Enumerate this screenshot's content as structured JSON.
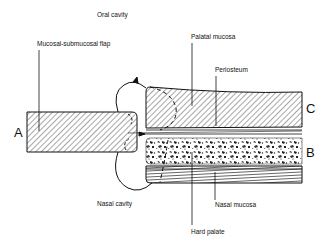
{
  "diagram": {
    "type": "surgical-anatomy-cross-section",
    "labels": {
      "oral_cavity": "Oral cavity",
      "mucosal_flap": "Mucosal-submucosal flap",
      "palatal_mucosa": "Palatal mucosa",
      "periosteum": "Periosteum",
      "nasal_cavity": "Nasal cavity",
      "nasal_mucosa": "Nasal mucosa",
      "hard_palate": "Hard palate"
    },
    "letters": {
      "a": "A",
      "b": "B",
      "c": "C"
    },
    "colors": {
      "ink": "#111111",
      "background": "#ffffff"
    }
  }
}
